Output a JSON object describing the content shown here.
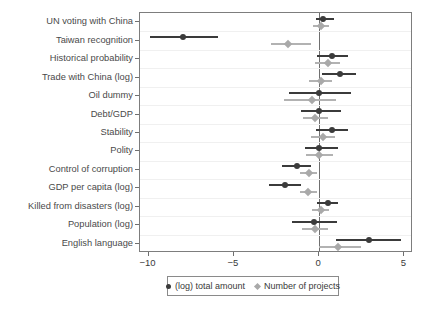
{
  "chart_data": {
    "type": "scatter",
    "title": "",
    "subtitle": "",
    "xlabel": "",
    "ylabel": "",
    "xlim": [
      -10.5,
      5.5
    ],
    "xticks": [
      -10,
      -5,
      0,
      5
    ],
    "xticklabels": [
      "−10",
      "−5",
      "0",
      "5"
    ],
    "grid": true,
    "grid_axis": "y",
    "legend_position": "bottom-center",
    "zero_reference_line": 0,
    "categories": [
      "UN voting with China",
      "Taiwan recognition",
      "Historical probability",
      "Trade with China (log)",
      "Oil dummy",
      "Debt/GDP",
      "Stability",
      "Polity",
      "Control of corruption",
      "GDP per capita (log)",
      "Killed from disasters (log)",
      "Population (log)",
      "English language"
    ],
    "series": [
      {
        "name": "(log) total amount",
        "marker": "circle",
        "color": "#3b3b3b",
        "values": [
          0.25,
          -8.0,
          0.75,
          1.2,
          0.0,
          0.0,
          0.75,
          0.0,
          -1.3,
          -2.0,
          0.5,
          -0.3,
          2.9
        ],
        "ci_low": [
          -0.2,
          -9.9,
          -0.1,
          0.15,
          -1.75,
          -1.05,
          -0.2,
          -0.85,
          -2.2,
          -2.95,
          -0.1,
          -1.6,
          1.0
        ],
        "ci_high": [
          0.85,
          -5.9,
          1.7,
          2.15,
          1.85,
          1.3,
          1.7,
          1.1,
          -0.45,
          -1.05,
          1.1,
          1.05,
          4.8
        ]
      },
      {
        "name": "Number of projects",
        "marker": "diamond",
        "color": "#a9a9a9",
        "values": [
          0.1,
          -1.8,
          0.5,
          0.1,
          -0.4,
          -0.25,
          0.25,
          0.0,
          -0.6,
          -0.65,
          0.1,
          -0.25,
          1.1
        ],
        "ci_low": [
          -0.35,
          -2.85,
          -0.25,
          -0.6,
          -2.05,
          -0.95,
          -0.5,
          -0.8,
          -1.1,
          -1.15,
          -0.4,
          -1.0,
          0.0
        ],
        "ci_high": [
          0.6,
          -0.5,
          1.25,
          0.75,
          1.0,
          0.5,
          0.95,
          0.8,
          -0.1,
          -0.15,
          0.6,
          0.5,
          2.45
        ]
      }
    ]
  },
  "legend": {
    "items": [
      {
        "label": "(log) total amount",
        "marker": "circle-marker"
      },
      {
        "label": "Number of projects",
        "marker": "diamond-marker"
      }
    ]
  },
  "colors": {
    "dark_series": "#3b3b3b",
    "gray_series": "#a9a9a9",
    "axis": "#7d7d7d",
    "grid": "#f0f0f0",
    "background": "#ffffff"
  }
}
